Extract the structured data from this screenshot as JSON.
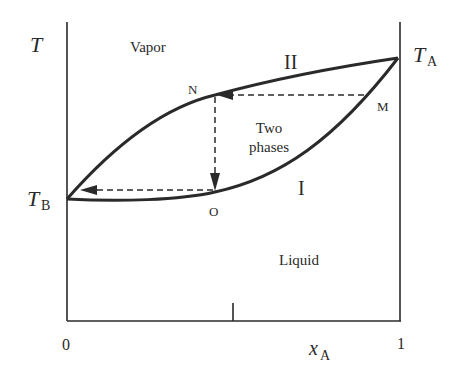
{
  "diagram": {
    "type": "binary liquid-vapor phase diagram (temperature vs composition)",
    "axes": {
      "y_label": "T",
      "x_label_main": "x",
      "x_label_sub": "A",
      "x_min_label": "0",
      "x_max_label": "1"
    },
    "points": {
      "TB_main": "T",
      "TB_sub": "B",
      "TA_main": "T",
      "TA_sub": "A",
      "N": "N",
      "M": "M",
      "O": "O"
    },
    "curves": {
      "upper": "II",
      "lower": "I"
    },
    "regions": {
      "vapor": "Vapor",
      "two_phases_line1": "Two",
      "two_phases_line2": "phases",
      "liquid": "Liquid"
    },
    "colors": {
      "line": "#2a2a2a",
      "background": "#ffffff"
    }
  }
}
